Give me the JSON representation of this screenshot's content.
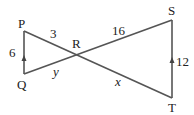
{
  "diagram": {
    "type": "two triangles sharing vertex R (bowtie), PQ parallel to ST",
    "points": {
      "P": {
        "label": "P",
        "x": 24,
        "y": 31
      },
      "Q": {
        "label": "Q",
        "x": 24,
        "y": 74
      },
      "R": {
        "label": "R",
        "x": 77,
        "y": 55
      },
      "S": {
        "label": "S",
        "x": 172,
        "y": 20
      },
      "T": {
        "label": "T",
        "x": 172,
        "y": 98
      }
    },
    "segments": [
      {
        "from": "P",
        "to": "R",
        "label": "3"
      },
      {
        "from": "R",
        "to": "S",
        "label": "16"
      },
      {
        "from": "P",
        "to": "Q",
        "label": "6",
        "arrow": "up"
      },
      {
        "from": "Q",
        "to": "R",
        "label": "y"
      },
      {
        "from": "R",
        "to": "T",
        "label": "x"
      },
      {
        "from": "T",
        "to": "S",
        "label": "12",
        "arrow": "up"
      }
    ],
    "line_color": "#555555"
  },
  "labels": {
    "P": "P",
    "Q": "Q",
    "R": "R",
    "S": "S",
    "T": "T",
    "PR": "3",
    "RS": "16",
    "PQ": "6",
    "QR": "y",
    "RT": "x",
    "ST": "12"
  }
}
